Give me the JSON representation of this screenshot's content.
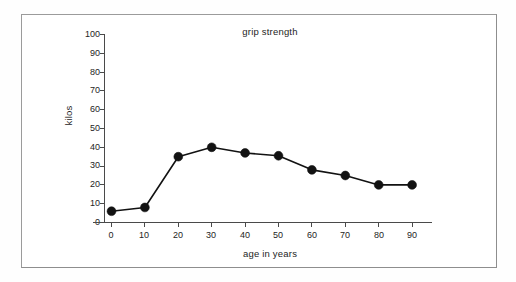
{
  "chart_data": {
    "type": "line",
    "title": "grip strength",
    "xlabel": "age in years",
    "ylabel": "kilos",
    "x": [
      0,
      10,
      20,
      30,
      40,
      50,
      60,
      70,
      80,
      90
    ],
    "values": [
      6,
      8,
      35,
      40,
      37,
      35.5,
      28,
      25,
      20,
      20
    ],
    "xticks": [
      "0",
      "10",
      "20",
      "30",
      "40",
      "50",
      "60",
      "70",
      "80",
      "90"
    ],
    "yticks": [
      "0",
      "10",
      "20",
      "30",
      "40",
      "50",
      "60",
      "70",
      "80",
      "90",
      "100"
    ],
    "xlim": [
      0,
      90
    ],
    "ylim": [
      0,
      100
    ],
    "grid": false,
    "legend": false,
    "marker": "filled-circle",
    "line_color": "#121212",
    "marker_color": "#121212",
    "axis_color": "#4a4a4a",
    "background": "#ffffff",
    "border_color": "#9b9b9b"
  }
}
